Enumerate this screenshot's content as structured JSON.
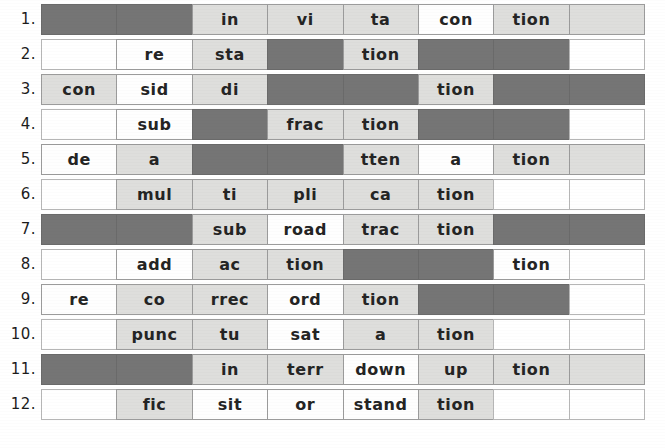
{
  "worksheet": {
    "title": "Syllable segmentation worksheet",
    "columns": 8,
    "legend": {
      "light_label": "light-gray syllable box",
      "white_label": "white syllable box",
      "dark_label": "shaded blank box",
      "blank_label": "empty box"
    },
    "colors": {
      "light": "#dededc",
      "white": "#fefefe",
      "dark": "#757575",
      "blank": "#ffffff",
      "border": "#9b9b9b",
      "text": "#242424",
      "page": "#ffffff"
    },
    "rows": [
      {
        "number": "1.",
        "word": "invitation",
        "cells": [
          {
            "text": "",
            "style": "dark"
          },
          {
            "text": "",
            "style": "dark"
          },
          {
            "text": "in",
            "style": "light"
          },
          {
            "text": "vi",
            "style": "light"
          },
          {
            "text": "ta",
            "style": "light"
          },
          {
            "text": "con",
            "style": "white"
          },
          {
            "text": "tion",
            "style": "light"
          },
          {
            "text": "",
            "style": "light"
          }
        ]
      },
      {
        "number": "2.",
        "word": "restation",
        "cells": [
          {
            "text": "",
            "style": "blank"
          },
          {
            "text": "re",
            "style": "white"
          },
          {
            "text": "sta",
            "style": "light"
          },
          {
            "text": "",
            "style": "dark"
          },
          {
            "text": "tion",
            "style": "light"
          },
          {
            "text": "",
            "style": "dark"
          },
          {
            "text": "",
            "style": "dark"
          },
          {
            "text": "",
            "style": "blank"
          }
        ]
      },
      {
        "number": "3.",
        "word": "consideration",
        "cells": [
          {
            "text": "con",
            "style": "light"
          },
          {
            "text": "sid",
            "style": "white"
          },
          {
            "text": "di",
            "style": "light"
          },
          {
            "text": "",
            "style": "dark"
          },
          {
            "text": "",
            "style": "dark"
          },
          {
            "text": "tion",
            "style": "light"
          },
          {
            "text": "",
            "style": "dark"
          },
          {
            "text": "",
            "style": "dark"
          }
        ]
      },
      {
        "number": "4.",
        "word": "subfraction",
        "cells": [
          {
            "text": "",
            "style": "blank"
          },
          {
            "text": "sub",
            "style": "white"
          },
          {
            "text": "",
            "style": "dark"
          },
          {
            "text": "frac",
            "style": "light"
          },
          {
            "text": "tion",
            "style": "light"
          },
          {
            "text": "",
            "style": "dark"
          },
          {
            "text": "",
            "style": "dark"
          },
          {
            "text": "",
            "style": "blank"
          }
        ]
      },
      {
        "number": "5.",
        "word": "deattenation",
        "cells": [
          {
            "text": "de",
            "style": "white"
          },
          {
            "text": "a",
            "style": "light"
          },
          {
            "text": "",
            "style": "dark"
          },
          {
            "text": "",
            "style": "dark"
          },
          {
            "text": "tten",
            "style": "light"
          },
          {
            "text": "a",
            "style": "white"
          },
          {
            "text": "tion",
            "style": "light"
          },
          {
            "text": "",
            "style": "light"
          }
        ]
      },
      {
        "number": "6.",
        "word": "multiplication",
        "cells": [
          {
            "text": "",
            "style": "blank"
          },
          {
            "text": "mul",
            "style": "light"
          },
          {
            "text": "ti",
            "style": "light"
          },
          {
            "text": "pli",
            "style": "light"
          },
          {
            "text": "ca",
            "style": "light"
          },
          {
            "text": "tion",
            "style": "light"
          },
          {
            "text": "",
            "style": "blank"
          },
          {
            "text": "",
            "style": "blank"
          }
        ]
      },
      {
        "number": "7.",
        "word": "subroadtraction",
        "cells": [
          {
            "text": "",
            "style": "dark"
          },
          {
            "text": "",
            "style": "dark"
          },
          {
            "text": "sub",
            "style": "light"
          },
          {
            "text": "road",
            "style": "white"
          },
          {
            "text": "trac",
            "style": "light"
          },
          {
            "text": "tion",
            "style": "light"
          },
          {
            "text": "",
            "style": "dark"
          },
          {
            "text": "",
            "style": "dark"
          }
        ]
      },
      {
        "number": "8.",
        "word": "addaction",
        "cells": [
          {
            "text": "",
            "style": "blank"
          },
          {
            "text": "add",
            "style": "white"
          },
          {
            "text": "ac",
            "style": "light"
          },
          {
            "text": "tion",
            "style": "light"
          },
          {
            "text": "",
            "style": "dark"
          },
          {
            "text": "",
            "style": "dark"
          },
          {
            "text": "tion",
            "style": "white"
          },
          {
            "text": "",
            "style": "blank"
          }
        ]
      },
      {
        "number": "9.",
        "word": "recorrection",
        "cells": [
          {
            "text": "re",
            "style": "white"
          },
          {
            "text": "co",
            "style": "light"
          },
          {
            "text": "rrec",
            "style": "light"
          },
          {
            "text": "ord",
            "style": "white"
          },
          {
            "text": "tion",
            "style": "light"
          },
          {
            "text": "",
            "style": "dark"
          },
          {
            "text": "",
            "style": "dark"
          },
          {
            "text": "",
            "style": "blank"
          }
        ]
      },
      {
        "number": "10.",
        "word": "punctuation",
        "cells": [
          {
            "text": "",
            "style": "blank"
          },
          {
            "text": "punc",
            "style": "light"
          },
          {
            "text": "tu",
            "style": "light"
          },
          {
            "text": "sat",
            "style": "white"
          },
          {
            "text": "a",
            "style": "light"
          },
          {
            "text": "tion",
            "style": "light"
          },
          {
            "text": "",
            "style": "blank"
          },
          {
            "text": "",
            "style": "blank"
          }
        ]
      },
      {
        "number": "11.",
        "word": "interruption",
        "cells": [
          {
            "text": "",
            "style": "dark"
          },
          {
            "text": "",
            "style": "dark"
          },
          {
            "text": "in",
            "style": "light"
          },
          {
            "text": "terr",
            "style": "light"
          },
          {
            "text": "down",
            "style": "white"
          },
          {
            "text": "up",
            "style": "light"
          },
          {
            "text": "tion",
            "style": "light"
          },
          {
            "text": "",
            "style": "light"
          }
        ]
      },
      {
        "number": "12.",
        "word": "ficsitorstandtion",
        "cells": [
          {
            "text": "",
            "style": "blank"
          },
          {
            "text": "fic",
            "style": "light"
          },
          {
            "text": "sit",
            "style": "white"
          },
          {
            "text": "or",
            "style": "white"
          },
          {
            "text": "stand",
            "style": "white"
          },
          {
            "text": "tion",
            "style": "light"
          },
          {
            "text": "",
            "style": "blank"
          },
          {
            "text": "",
            "style": "blank"
          }
        ]
      }
    ]
  }
}
